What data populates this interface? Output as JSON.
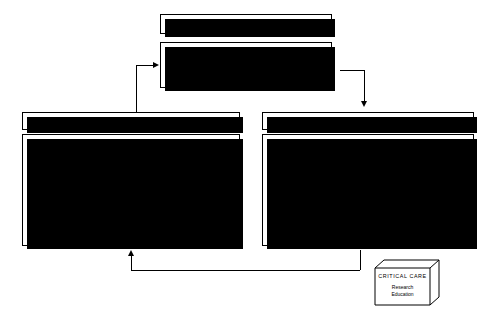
{
  "diagram": {
    "patient_care": {
      "banner_label": "Patient Care Function",
      "units_box": {
        "title": "CRITICAL CARE UNITS",
        "units": [
          "Medical/Surgical  ICU",
          "Cardiovascular  ICU",
          "Trauma  ICU"
        ],
        "outputs": [
          "policies",
          "procedures"
        ]
      }
    },
    "decision": {
      "banner_label": "Decision Function",
      "responsibility_box": {
        "title": "RESPONSIBILITY FOR QUALITY\nASSURANCE & UTILIZATION",
        "items": [
          "Coordinator or Critical Care",
          "Director of C.C. Nursing",
          "Critical Care Committee"
        ]
      },
      "meeting_box": {
        "title": "MULTI-DISCIPLINARY MEETING\nWITH UNIT STAFF",
        "items": [
          "secondary  analysis",
          "response  to  data",
          "revise  policies/procedures"
        ]
      },
      "report_label": "REPORT"
    },
    "database": {
      "banner_label": "Database Function",
      "data_collection": {
        "title": "DATA COLLECTION",
        "items": [
          "demographic data",
          "TISS",
          "GRASP",
          "APACHE",
          "length of stay",
          "diagnosis",
          "procedures",
          "complications",
          "outcome"
        ]
      },
      "data_management": {
        "title": "DATA MANAGEMENT",
        "lead_line": "Health  Records  Department",
        "items": [
          "abstracting data",
          "data entry"
        ]
      },
      "data_analysis": {
        "title": "DATA ANALYSIS",
        "items": [
          "primary  analysis",
          "report  generation"
        ]
      }
    },
    "critical_care_cube": {
      "title": "CRITICAL   CARE",
      "items": [
        "Research",
        "Education"
      ]
    },
    "colors": {
      "stroke": "#000000",
      "background": "#ffffff",
      "shadow": "#000000"
    }
  }
}
